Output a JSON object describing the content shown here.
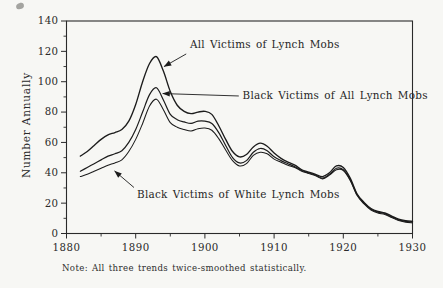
{
  "chart_data": {
    "type": "line",
    "title": "",
    "xlabel": "",
    "ylabel": "Number Annually",
    "note": "Note: All three trends twice-smoothed statistically.",
    "xlim": [
      1880,
      1930
    ],
    "ylim": [
      0,
      140
    ],
    "grid": false,
    "line_color": "#1c1c1c",
    "x_major_ticks": [
      1880,
      1890,
      1900,
      1910,
      1920,
      1930
    ],
    "x_minor_ticks": [
      1885,
      1895,
      1905,
      1915,
      1925
    ],
    "y_major_ticks": [
      0,
      20,
      40,
      60,
      80,
      100,
      120,
      140
    ],
    "y_minor_ticks": [
      10,
      30,
      50,
      70,
      90,
      110,
      130
    ],
    "start_year": 1882,
    "series": [
      {
        "name": "All Victims of Lynch Mobs",
        "values": [
          51,
          54,
          58,
          62,
          65,
          66.5,
          68.5,
          74,
          85,
          100,
          112,
          116.5,
          107,
          93.5,
          84.5,
          80.5,
          79,
          80,
          80.5,
          78.5,
          71,
          62,
          54,
          50.5,
          52,
          57,
          59.5,
          57.5,
          53,
          49.5,
          47,
          45,
          42,
          40.5,
          39,
          37.5,
          40,
          44.5,
          43.5,
          36.5,
          26,
          20.5,
          16.5,
          14.5,
          13.5,
          11.5,
          9.5,
          8.5,
          8
        ]
      },
      {
        "name": "Black Victims of All Lynch Mobs",
        "values": [
          41,
          43.5,
          46,
          48.5,
          51,
          52.5,
          54.5,
          60,
          68.5,
          80,
          91.5,
          96,
          88,
          78.5,
          75,
          73.5,
          72.5,
          74,
          74,
          72.5,
          66.5,
          58,
          50,
          46.5,
          48,
          53.5,
          56,
          54.5,
          50.5,
          48,
          46,
          44,
          41.5,
          40,
          38.5,
          36.5,
          39,
          43,
          42,
          35.5,
          25.5,
          20,
          16,
          14,
          13,
          11,
          9,
          8,
          7.5
        ]
      },
      {
        "name": "Black Victims of White Lynch Mobs",
        "values": [
          37.5,
          39,
          41,
          43,
          45,
          46.5,
          48.5,
          54,
          62,
          72.5,
          84,
          88.5,
          81.5,
          73,
          70,
          68.5,
          67.5,
          69,
          69.5,
          68,
          62.5,
          55,
          48,
          44.5,
          46,
          51.5,
          53.5,
          52.5,
          49,
          47,
          45,
          43.5,
          41,
          39.5,
          38,
          36,
          38.5,
          42,
          41.5,
          35,
          25,
          19.5,
          15.5,
          13.5,
          12.5,
          10.5,
          8.5,
          7.5,
          7
        ]
      }
    ],
    "annotations": [
      {
        "label": "All Victims of Lynch Mobs",
        "text_at": {
          "year": 1897.85,
          "value": 122.5
        },
        "arrow_from": {
          "year": 1897.3,
          "value": 118.3
        },
        "arrow_to": {
          "year": 1894.1,
          "value": 110.0
        }
      },
      {
        "label": "Black Victims of All Lynch Mobs",
        "text_at": {
          "year": 1905.45,
          "value": 88.3
        },
        "arrow_from": {
          "year": 1904.9,
          "value": 90.6
        },
        "arrow_to": {
          "year": 1893.9,
          "value": 92.2
        }
      },
      {
        "label": "Black Victims of White Lynch Mobs",
        "text_at": {
          "year": 1890.2,
          "value": 23.1
        },
        "arrow_from": {
          "year": 1889.75,
          "value": 30.3
        },
        "arrow_to": {
          "year": 1886.95,
          "value": 41.2
        }
      }
    ]
  }
}
